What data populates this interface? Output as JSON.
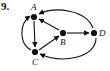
{
  "figure": {
    "item_number": "9.",
    "type": "directed-graph",
    "width": 110,
    "height": 71,
    "background_color": "#ffffff",
    "ink_color": "#111111",
    "nodes": [
      {
        "id": "A",
        "label": "A",
        "x": 34,
        "y": 17,
        "label_x": 31,
        "label_y": 10
      },
      {
        "id": "B",
        "label": "B",
        "x": 63,
        "y": 33,
        "label_x": 60,
        "label_y": 45
      },
      {
        "id": "C",
        "label": "C",
        "x": 35,
        "y": 52,
        "label_x": 32,
        "label_y": 65
      },
      {
        "id": "D",
        "label": "D",
        "x": 94,
        "y": 33,
        "label_x": 99,
        "label_y": 36
      }
    ],
    "edges": [
      {
        "from": "D",
        "to": "A",
        "style": "curved",
        "note": "long arc over the top"
      },
      {
        "from": "B",
        "to": "A",
        "style": "straight",
        "note": "diagonal up-left"
      },
      {
        "from": "C",
        "to": "A",
        "style": "curved",
        "note": "arc around the left side"
      },
      {
        "from": "A",
        "to": "C",
        "style": "straight",
        "note": "vertical down"
      },
      {
        "from": "C",
        "to": "B",
        "style": "straight",
        "note": "diagonal up-right"
      },
      {
        "from": "B",
        "to": "D",
        "style": "straight",
        "note": "horizontal right"
      },
      {
        "from": "D",
        "to": "C",
        "style": "curved",
        "note": "long arc under the bottom"
      }
    ]
  }
}
